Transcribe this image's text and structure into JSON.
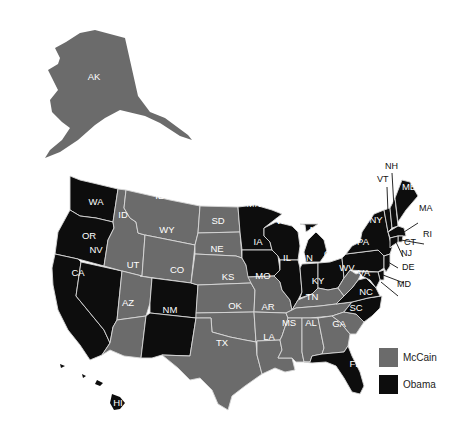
{
  "legend": {
    "items": [
      {
        "label": "McCain",
        "color": "#6b6b6b"
      },
      {
        "label": "Obama",
        "color": "#0d0d0d"
      }
    ]
  },
  "colors": {
    "mccain": "#6b6b6b",
    "obama": "#0d0d0d",
    "border": "#d8d8d8"
  },
  "states": {
    "AK": {
      "label": "AK",
      "winner": "McCain"
    },
    "HI": {
      "label": "HI",
      "winner": "Obama"
    },
    "WA": {
      "label": "WA",
      "winner": "Obama"
    },
    "OR": {
      "label": "OR",
      "winner": "Obama"
    },
    "CA": {
      "label": "CA",
      "winner": "Obama"
    },
    "NV": {
      "label": "NV",
      "winner": "Obama"
    },
    "ID": {
      "label": "ID",
      "winner": "McCain"
    },
    "MT": {
      "label": "ID",
      "winner": "McCain"
    },
    "WY": {
      "label": "WY",
      "winner": "McCain"
    },
    "UT": {
      "label": "UT",
      "winner": "McCain"
    },
    "AZ": {
      "label": "AZ",
      "winner": "McCain"
    },
    "CO": {
      "label": "CO",
      "winner": "Obama"
    },
    "NM": {
      "label": "NM",
      "winner": "Obama"
    },
    "ND": {
      "label": "ND",
      "winner": "McCain"
    },
    "SD": {
      "label": "SD",
      "winner": "McCain"
    },
    "NE": {
      "label": "NE",
      "winner": "McCain"
    },
    "KS": {
      "label": "KS",
      "winner": "McCain"
    },
    "OK": {
      "label": "OK",
      "winner": "McCain"
    },
    "TX": {
      "label": "TX",
      "winner": "McCain"
    },
    "MN": {
      "label": "MN",
      "winner": "Obama"
    },
    "IA": {
      "label": "IA",
      "winner": "Obama"
    },
    "MO": {
      "label": "MO",
      "winner": "McCain"
    },
    "AR": {
      "label": "AR",
      "winner": "McCain"
    },
    "LA": {
      "label": "LA",
      "winner": "McCain"
    },
    "WI": {
      "label": "WI",
      "winner": "Obama"
    },
    "IL": {
      "label": "IL",
      "winner": "Obama"
    },
    "MI": {
      "label": "MI",
      "winner": "Obama"
    },
    "IN": {
      "label": "IN",
      "winner": "Obama"
    },
    "OH": {
      "label": "OH",
      "winner": "Obama"
    },
    "KY": {
      "label": "KY",
      "winner": "McCain"
    },
    "TN": {
      "label": "TN",
      "winner": "McCain"
    },
    "MS": {
      "label": "MS",
      "winner": "McCain"
    },
    "AL": {
      "label": "AL",
      "winner": "McCain"
    },
    "GA": {
      "label": "GA",
      "winner": "McCain"
    },
    "FL": {
      "label": "FL",
      "winner": "Obama"
    },
    "SC": {
      "label": "SC",
      "winner": "McCain"
    },
    "NC": {
      "label": "NC",
      "winner": "Obama"
    },
    "VA": {
      "label": "VA",
      "winner": "Obama"
    },
    "WV": {
      "label": "WV",
      "winner": "McCain"
    },
    "PA": {
      "label": "PA",
      "winner": "Obama"
    },
    "NY": {
      "label": "NY",
      "winner": "Obama"
    },
    "VT": {
      "label": "VT",
      "winner": "Obama"
    },
    "NH": {
      "label": "NH",
      "winner": "Obama"
    },
    "ME": {
      "label": "ME",
      "winner": "Obama"
    },
    "MA": {
      "label": "MA",
      "winner": "Obama"
    },
    "RI": {
      "label": "RI",
      "winner": "Obama"
    },
    "CT": {
      "label": "CT",
      "winner": "Obama"
    },
    "NJ": {
      "label": "NJ",
      "winner": "Obama"
    },
    "DE": {
      "label": "DE",
      "winner": "Obama"
    },
    "MD": {
      "label": "MD",
      "winner": "Obama"
    }
  }
}
